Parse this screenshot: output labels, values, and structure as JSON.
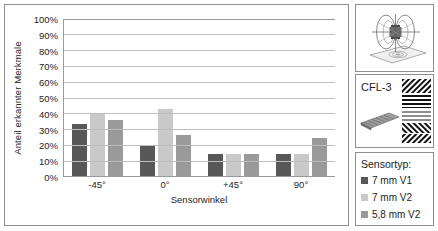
{
  "chart_data": {
    "type": "bar",
    "title": "",
    "xlabel": "Sensorwinkel",
    "ylabel": "Anteil erkannter Merkmale",
    "categories": [
      "-45°",
      "0°",
      "+45°",
      "90°"
    ],
    "ylim": [
      0,
      100
    ],
    "ytick_labels": [
      "0%",
      "10%",
      "20%",
      "30%",
      "40%",
      "50%",
      "60%",
      "70%",
      "80%",
      "90%",
      "100%"
    ],
    "ytick_values": [
      0,
      10,
      20,
      30,
      40,
      50,
      60,
      70,
      80,
      90,
      100
    ],
    "grid": true,
    "legend_position": "right-panel",
    "series": [
      {
        "name": "7 mm V1",
        "color": "#585858",
        "values": [
          33,
          19.5,
          14,
          14
        ]
      },
      {
        "name": "7 mm V2",
        "color": "#c9c9c9",
        "values": [
          40,
          42.5,
          14,
          14
        ]
      },
      {
        "name": "5,8 mm V2",
        "color": "#9a9a9a",
        "values": [
          35.5,
          26,
          14,
          24
        ]
      }
    ]
  },
  "legend": {
    "title": "Sensortyp:",
    "items": [
      {
        "label": "7 mm V1",
        "color": "#585858"
      },
      {
        "label": "7 mm V2",
        "color": "#c9c9c9"
      },
      {
        "label": "5,8 mm V2",
        "color": "#9a9a9a"
      }
    ]
  },
  "specimen": {
    "label": "CFL-3"
  }
}
